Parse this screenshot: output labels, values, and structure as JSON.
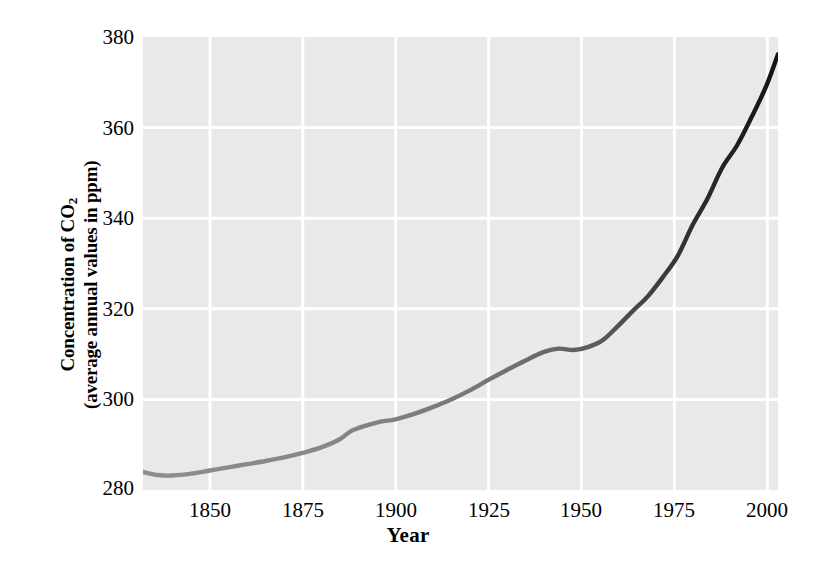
{
  "chart_data": {
    "type": "line",
    "title": "",
    "xlabel": "Year",
    "ylabel_line1": "Concentration of CO",
    "ylabel_sub": "2",
    "ylabel_line2": "(average annual values in ppm)",
    "ylabel_full": "Concentration of CO2 (average annual values in ppm)",
    "xlim": [
      1832,
      2003
    ],
    "ylim": [
      280,
      380
    ],
    "xticks": [
      1850,
      1875,
      1900,
      1925,
      1950,
      1975,
      2000
    ],
    "xticklabels": [
      "1850",
      "1875",
      "1900",
      "1925",
      "1950",
      "1975",
      "2000"
    ],
    "yticks": [
      280,
      300,
      320,
      340,
      360,
      380
    ],
    "yticklabels": [
      "280",
      "300",
      "320",
      "340",
      "360",
      "380"
    ],
    "grid": true,
    "grid_color": "#ffffff",
    "plot_background": "#e9e9e9",
    "page_background": "#ffffff",
    "line_color_start": "#8c8c8c",
    "line_color_end": "#1a1a1a",
    "line_width": 4,
    "series": [
      {
        "name": "Atmospheric CO2 concentration",
        "x": [
          1832,
          1836,
          1840,
          1845,
          1850,
          1855,
          1860,
          1865,
          1870,
          1875,
          1880,
          1885,
          1888,
          1892,
          1896,
          1900,
          1905,
          1910,
          1915,
          1920,
          1925,
          1930,
          1935,
          1940,
          1944,
          1948,
          1952,
          1956,
          1960,
          1964,
          1968,
          1972,
          1976,
          1980,
          1984,
          1988,
          1992,
          1996,
          2000,
          2003
        ],
        "y": [
          284.0,
          283.3,
          283.2,
          283.6,
          284.3,
          285.0,
          285.7,
          286.4,
          287.2,
          288.2,
          289.4,
          291.2,
          293.0,
          294.2,
          295.1,
          295.6,
          296.8,
          298.3,
          300.0,
          302.0,
          304.3,
          306.5,
          308.6,
          310.5,
          311.2,
          310.9,
          311.6,
          313.2,
          316.3,
          319.6,
          322.8,
          327.0,
          331.7,
          338.5,
          344.3,
          351.2,
          356.1,
          362.5,
          369.5,
          376.2
        ]
      }
    ],
    "annotations": []
  }
}
